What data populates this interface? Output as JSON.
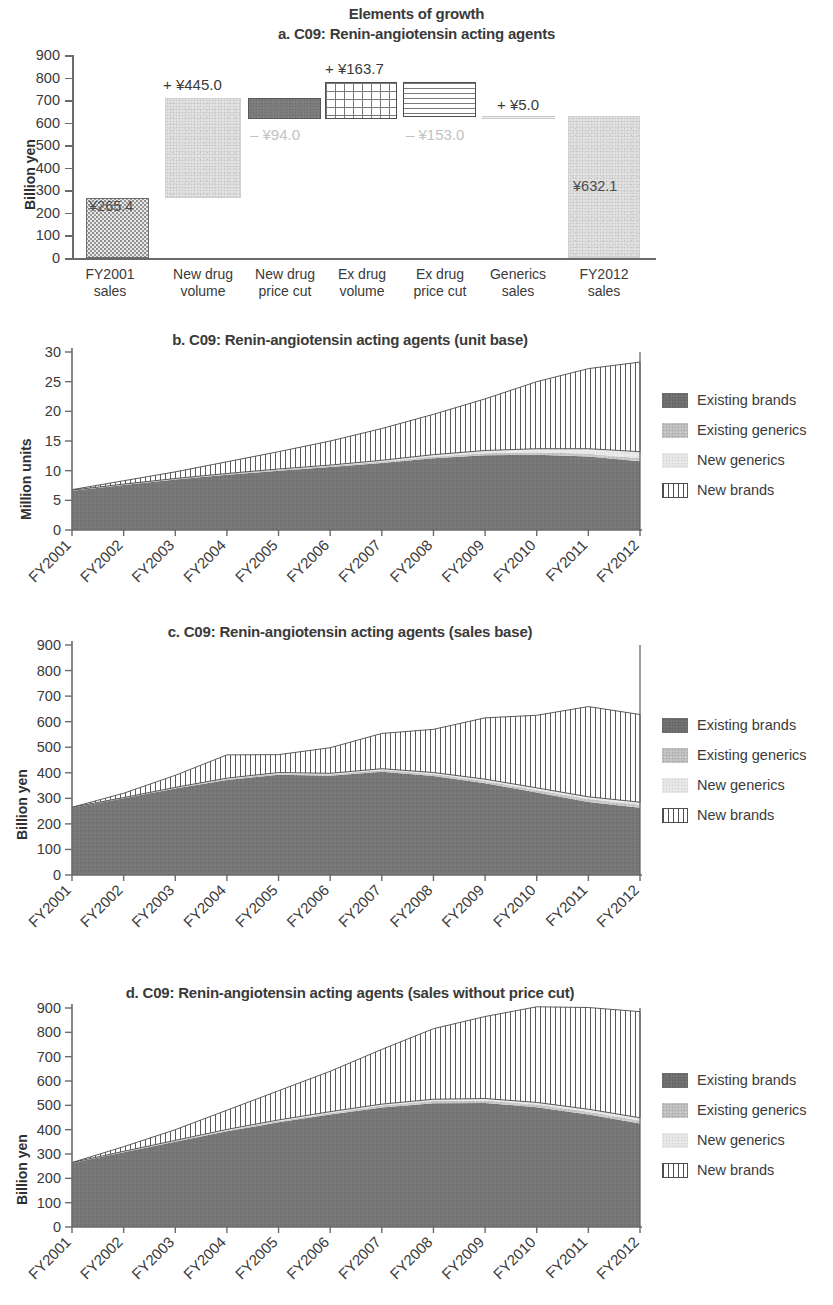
{
  "figure": {
    "suptitle": "Elements of growth"
  },
  "legend": {
    "items": [
      {
        "label": "Existing brands",
        "swatch": "existing-brands-swatch",
        "color": "#6f6f6f"
      },
      {
        "label": "Existing generics",
        "swatch": "existing-generics-swatch",
        "color": "#c3c3c3"
      },
      {
        "label": "New generics",
        "swatch": "new-generics-swatch",
        "color": "#e6e6e6"
      },
      {
        "label": "New brands",
        "swatch": "new-brands-swatch",
        "color": "#ffffff"
      }
    ]
  },
  "chart_data": [
    {
      "id": "panel-a",
      "type": "bar",
      "title": "a. C09: Renin-angiotensin acting agents",
      "xlabel": "",
      "ylabel": "Billion yen",
      "ylim": [
        0,
        900
      ],
      "yticks": [
        0,
        100,
        200,
        300,
        400,
        500,
        600,
        700,
        800,
        900
      ],
      "grid": false,
      "waterfall": true,
      "categories": [
        "FY2001 sales",
        "New drug volume",
        "New drug price cut",
        "Ex drug volume",
        "Ex drug price cut",
        "Generics sales",
        "FY2012 sales"
      ],
      "category_lines": [
        [
          "FY2001",
          "sales"
        ],
        [
          "New drug",
          "volume"
        ],
        [
          "New drug",
          "price cut"
        ],
        [
          "Ex drug",
          "volume"
        ],
        [
          "Ex drug",
          "price cut"
        ],
        [
          "Generics",
          "sales"
        ],
        [
          "FY2012",
          "sales"
        ]
      ],
      "deltas": [
        265.4,
        445.0,
        -94.0,
        163.7,
        -153.0,
        5.0,
        632.1
      ],
      "bar_bottoms": [
        0.0,
        265.4,
        616.4,
        616.4,
        627.1,
        627.1,
        0.0
      ],
      "bar_tops": [
        265.4,
        710.4,
        710.4,
        780.1,
        780.1,
        632.1,
        632.1
      ],
      "value_labels": [
        "¥265.4",
        "+ ¥445.0",
        "– ¥94.0",
        "+ ¥163.7",
        "– ¥153.0",
        "+ ¥5.0",
        "¥632.1"
      ],
      "patterns": [
        "dots",
        "speckle",
        "solid-dark",
        "grid",
        "horizontal-lines",
        "thin-line",
        "speckle"
      ]
    },
    {
      "id": "panel-b",
      "type": "area",
      "title": "b. C09: Renin-angiotensin acting agents (unit base)",
      "xlabel": "",
      "ylabel": "Million units",
      "ylim": [
        0,
        30
      ],
      "yticks": [
        0,
        5,
        10,
        15,
        20,
        25,
        30
      ],
      "grid": false,
      "categories": [
        "FY2001",
        "FY2002",
        "FY2003",
        "FY2004",
        "FY2005",
        "FY2006",
        "FY2007",
        "FY2008",
        "FY2009",
        "FY2010",
        "FY2011",
        "FY2012"
      ],
      "series": [
        {
          "name": "Existing brands",
          "values": [
            6.6,
            7.6,
            8.5,
            9.3,
            10.0,
            10.6,
            11.3,
            12.1,
            12.6,
            12.7,
            12.4,
            11.6
          ]
        },
        {
          "name": "Existing generics",
          "values": [
            0.12,
            0.14,
            0.16,
            0.18,
            0.2,
            0.22,
            0.25,
            0.3,
            0.35,
            0.4,
            0.45,
            0.5
          ]
        },
        {
          "name": "New generics",
          "values": [
            0.0,
            0.0,
            0.02,
            0.05,
            0.08,
            0.12,
            0.2,
            0.3,
            0.45,
            0.6,
            0.85,
            1.1
          ]
        },
        {
          "name": "New brands",
          "values": [
            0.08,
            0.56,
            1.12,
            1.97,
            2.92,
            4.06,
            5.35,
            6.8,
            8.7,
            11.3,
            13.5,
            15.1
          ]
        }
      ],
      "totals": [
        6.8,
        8.3,
        9.8,
        11.5,
        13.2,
        15.0,
        17.1,
        19.5,
        22.1,
        25.0,
        27.2,
        28.3
      ]
    },
    {
      "id": "panel-c",
      "type": "area",
      "title": "c. C09: Renin-angiotensin acting agents (sales base)",
      "xlabel": "",
      "ylabel": "Billion yen",
      "ylim": [
        0,
        900
      ],
      "yticks": [
        0,
        100,
        200,
        300,
        400,
        500,
        600,
        700,
        800,
        900
      ],
      "grid": false,
      "categories": [
        "FY2001",
        "FY2002",
        "FY2003",
        "FY2004",
        "FY2005",
        "FY2006",
        "FY2007",
        "FY2008",
        "FY2009",
        "FY2010",
        "FY2011",
        "FY2012"
      ],
      "series": [
        {
          "name": "Existing brands",
          "values": [
            263,
            300,
            338,
            372,
            392,
            388,
            404,
            387,
            359,
            323,
            286,
            263
          ]
        },
        {
          "name": "Existing generics",
          "values": [
            2,
            3,
            4,
            5,
            6,
            6,
            7,
            8,
            9,
            10,
            11,
            12
          ]
        },
        {
          "name": "New generics",
          "values": [
            0,
            0,
            1,
            2,
            3,
            4,
            5,
            6,
            7,
            8,
            9,
            10
          ]
        },
        {
          "name": "New brands",
          "values": [
            0,
            17,
            47,
            91,
            70,
            100,
            138,
            169,
            240,
            284,
            353,
            343
          ]
        }
      ],
      "totals": [
        265,
        320,
        390,
        470,
        471,
        498,
        554,
        570,
        615,
        625,
        659,
        628
      ]
    },
    {
      "id": "panel-d",
      "type": "area",
      "title": "d. C09: Renin-angiotensin acting agents (sales without price cut)",
      "xlabel": "",
      "ylabel": "Billion yen",
      "ylim": [
        0,
        900
      ],
      "yticks": [
        0,
        100,
        200,
        300,
        400,
        500,
        600,
        700,
        800,
        900
      ],
      "grid": false,
      "categories": [
        "FY2001",
        "FY2002",
        "FY2003",
        "FY2004",
        "FY2005",
        "FY2006",
        "FY2007",
        "FY2008",
        "FY2009",
        "FY2010",
        "FY2011",
        "FY2012"
      ],
      "series": [
        {
          "name": "Existing brands",
          "values": [
            263,
            307,
            350,
            393,
            430,
            462,
            491,
            509,
            510,
            492,
            462,
            425
          ]
        },
        {
          "name": "Existing generics",
          "values": [
            2,
            3,
            4,
            5,
            6,
            7,
            8,
            9,
            10,
            11,
            12,
            13
          ]
        },
        {
          "name": "New generics",
          "values": [
            0,
            1,
            2,
            3,
            4,
            5,
            6,
            7,
            8,
            9,
            10,
            11
          ]
        },
        {
          "name": "New brands",
          "values": [
            0,
            19,
            44,
            79,
            120,
            166,
            225,
            290,
            337,
            393,
            418,
            436
          ]
        }
      ],
      "totals": [
        265,
        330,
        400,
        480,
        560,
        640,
        730,
        815,
        865,
        905,
        902,
        885
      ]
    }
  ]
}
